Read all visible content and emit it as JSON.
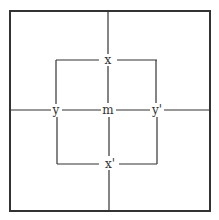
{
  "diagram": {
    "colors": {
      "line": "#333333",
      "background": "#ffffff"
    },
    "outer_box": {
      "x": 10,
      "y": 11,
      "w": 200,
      "h": 200
    },
    "inner_box": {
      "x": 56,
      "y": 60,
      "w": 101,
      "h": 104
    },
    "labels": {
      "top": "x",
      "bottom": "x'",
      "left": "y",
      "right": "y'",
      "center": "m"
    }
  }
}
